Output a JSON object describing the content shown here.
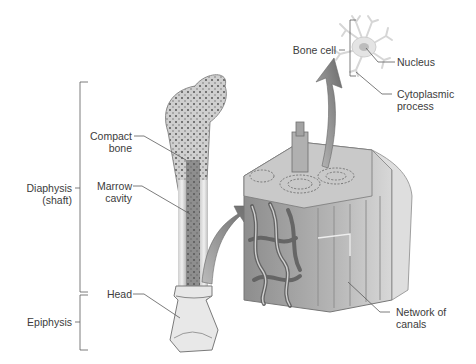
{
  "diagram": {
    "labels": {
      "compact_bone": [
        "Compact",
        "bone"
      ],
      "marrow_cavity": [
        "Marrow",
        "cavity"
      ],
      "diaphysis": [
        "Diaphysis",
        "(shaft)"
      ],
      "head": "Head",
      "epiphysis": "Epiphysis",
      "bone_cell": "Bone cell",
      "nucleus": "Nucleus",
      "cytoplasmic_process": [
        "Cytoplasmic",
        "process"
      ],
      "network_of_canals": [
        "Network of",
        "canals"
      ]
    },
    "colors": {
      "line": "#555555",
      "bone_light": "#e6e6e6",
      "bone_mid": "#bdbdbd",
      "bone_dark": "#6e6e6e",
      "arrow": "#7a7a7a",
      "cell": "#dcdcdc"
    }
  }
}
